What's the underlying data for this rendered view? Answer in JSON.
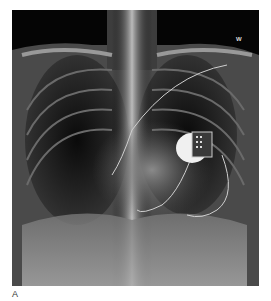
{
  "figure": {
    "panel_label": "A",
    "image_marker": "W",
    "image_description": "Chest X-ray (PA view) showing an implanted pacemaker/device with leads in the left chest"
  }
}
